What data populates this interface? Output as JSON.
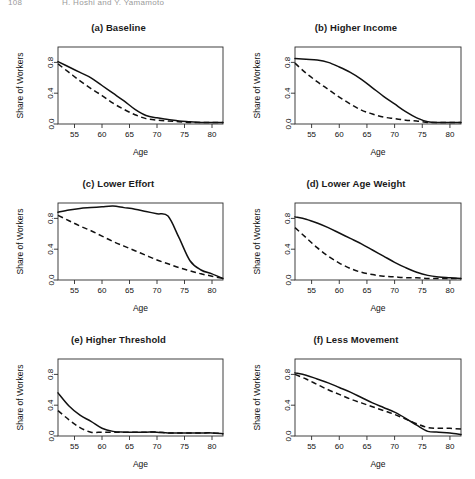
{
  "running_header": {
    "page_number": "108",
    "title": "H. Hoshi and Y. Yamamoto"
  },
  "figure": {
    "x_axis_label": "Age",
    "y_axis_label": "Share of Workers",
    "x_ticks": [
      55,
      60,
      65,
      70,
      75,
      80
    ],
    "y_ticks": [
      "0.0",
      "0.4",
      "0.8"
    ],
    "series_names": [
      "solid",
      "dashed"
    ]
  },
  "chart_data": [
    {
      "type": "line",
      "panel": "a",
      "title": "(a) Baseline",
      "xlabel": "Age",
      "ylabel": "Share of Workers",
      "xlim": [
        52,
        82
      ],
      "ylim": [
        0.0,
        1.0
      ],
      "xticks": [
        55,
        60,
        65,
        70,
        75,
        80
      ],
      "yticks": [
        0.0,
        0.4,
        0.8
      ],
      "grid": false,
      "legend": "none",
      "x": [
        52,
        54,
        56,
        58,
        60,
        62,
        64,
        66,
        68,
        70,
        72,
        74,
        76,
        78,
        80,
        82
      ],
      "series": [
        {
          "name": "solid",
          "style": "solid",
          "values": [
            0.81,
            0.74,
            0.67,
            0.6,
            0.5,
            0.4,
            0.3,
            0.19,
            0.11,
            0.08,
            0.06,
            0.04,
            0.03,
            0.02,
            0.02,
            0.02
          ]
        },
        {
          "name": "dashed",
          "style": "dashed",
          "values": [
            0.78,
            0.67,
            0.56,
            0.46,
            0.37,
            0.27,
            0.19,
            0.12,
            0.07,
            0.05,
            0.04,
            0.03,
            0.02,
            0.02,
            0.02,
            0.02
          ]
        }
      ]
    },
    {
      "type": "line",
      "panel": "b",
      "title": "(b) Higher Income",
      "xlabel": "Age",
      "ylabel": "Share of Workers",
      "xlim": [
        52,
        82
      ],
      "ylim": [
        0.0,
        1.0
      ],
      "xticks": [
        55,
        60,
        65,
        70,
        75,
        80
      ],
      "yticks": [
        0.0,
        0.4,
        0.8
      ],
      "grid": false,
      "legend": "none",
      "x": [
        52,
        54,
        56,
        58,
        60,
        62,
        64,
        66,
        68,
        70,
        72,
        74,
        76,
        78,
        80,
        82
      ],
      "series": [
        {
          "name": "solid",
          "style": "solid",
          "values": [
            0.85,
            0.84,
            0.83,
            0.8,
            0.74,
            0.67,
            0.58,
            0.47,
            0.36,
            0.26,
            0.16,
            0.08,
            0.03,
            0.02,
            0.02,
            0.02
          ]
        },
        {
          "name": "dashed",
          "style": "dashed",
          "values": [
            0.79,
            0.66,
            0.55,
            0.45,
            0.35,
            0.26,
            0.18,
            0.13,
            0.09,
            0.07,
            0.05,
            0.04,
            0.02,
            0.02,
            0.02,
            0.02
          ]
        }
      ]
    },
    {
      "type": "line",
      "panel": "c",
      "title": "(c) Lower Effort",
      "xlabel": "Age",
      "ylabel": "Share of Workers",
      "xlim": [
        52,
        82
      ],
      "ylim": [
        0.0,
        1.0
      ],
      "xticks": [
        55,
        60,
        65,
        70,
        75,
        80
      ],
      "yticks": [
        0.0,
        0.4,
        0.8
      ],
      "grid": false,
      "legend": "none",
      "x": [
        52,
        54,
        56,
        58,
        60,
        62,
        64,
        66,
        68,
        70,
        72,
        74,
        76,
        78,
        80,
        82
      ],
      "series": [
        {
          "name": "solid",
          "style": "solid",
          "values": [
            0.88,
            0.91,
            0.93,
            0.94,
            0.95,
            0.96,
            0.94,
            0.92,
            0.89,
            0.86,
            0.83,
            0.55,
            0.25,
            0.13,
            0.08,
            0.02
          ]
        },
        {
          "name": "dashed",
          "style": "dashed",
          "values": [
            0.84,
            0.77,
            0.7,
            0.64,
            0.57,
            0.5,
            0.44,
            0.38,
            0.32,
            0.26,
            0.21,
            0.16,
            0.12,
            0.08,
            0.05,
            0.02
          ]
        }
      ]
    },
    {
      "type": "line",
      "panel": "d",
      "title": "(d) Lower Age Weight",
      "xlabel": "Age",
      "ylabel": "Share of Workers",
      "xlim": [
        52,
        82
      ],
      "ylim": [
        0.0,
        1.0
      ],
      "xticks": [
        55,
        60,
        65,
        70,
        75,
        80
      ],
      "yticks": [
        0.0,
        0.4,
        0.8
      ],
      "grid": false,
      "legend": "none",
      "x": [
        52,
        54,
        56,
        58,
        60,
        62,
        64,
        66,
        68,
        70,
        72,
        74,
        76,
        78,
        80,
        82
      ],
      "series": [
        {
          "name": "solid",
          "style": "solid",
          "values": [
            0.82,
            0.79,
            0.74,
            0.68,
            0.61,
            0.54,
            0.47,
            0.39,
            0.31,
            0.23,
            0.16,
            0.1,
            0.06,
            0.04,
            0.03,
            0.02
          ]
        },
        {
          "name": "dashed",
          "style": "dashed",
          "values": [
            0.68,
            0.55,
            0.42,
            0.31,
            0.22,
            0.15,
            0.1,
            0.07,
            0.05,
            0.04,
            0.03,
            0.03,
            0.02,
            0.02,
            0.02,
            0.02
          ]
        }
      ]
    },
    {
      "type": "line",
      "panel": "e",
      "title": "(e) Higher Threshold",
      "xlabel": "Age",
      "ylabel": "Share of Workers",
      "xlim": [
        52,
        82
      ],
      "ylim": [
        0.0,
        1.0
      ],
      "xticks": [
        55,
        60,
        65,
        70,
        75,
        80
      ],
      "yticks": [
        0.0,
        0.4,
        0.8
      ],
      "grid": false,
      "legend": "none",
      "x": [
        52,
        54,
        56,
        58,
        60,
        62,
        64,
        66,
        68,
        70,
        72,
        74,
        76,
        78,
        80,
        82
      ],
      "series": [
        {
          "name": "solid",
          "style": "solid",
          "values": [
            0.56,
            0.39,
            0.27,
            0.19,
            0.1,
            0.06,
            0.05,
            0.05,
            0.05,
            0.05,
            0.04,
            0.04,
            0.04,
            0.04,
            0.04,
            0.03
          ]
        },
        {
          "name": "dashed",
          "style": "dashed",
          "values": [
            0.33,
            0.21,
            0.11,
            0.05,
            0.05,
            0.05,
            0.05,
            0.05,
            0.05,
            0.05,
            0.04,
            0.04,
            0.04,
            0.04,
            0.04,
            0.03
          ]
        }
      ]
    },
    {
      "type": "line",
      "panel": "f",
      "title": "(f) Less Movement",
      "xlabel": "Age",
      "ylabel": "Share of Workers",
      "xlim": [
        52,
        82
      ],
      "ylim": [
        0.0,
        1.0
      ],
      "xticks": [
        55,
        60,
        65,
        70,
        75,
        80
      ],
      "yticks": [
        0.0,
        0.4,
        0.8
      ],
      "grid": false,
      "legend": "none",
      "x": [
        52,
        54,
        56,
        58,
        60,
        62,
        64,
        66,
        68,
        70,
        72,
        74,
        76,
        78,
        80,
        82
      ],
      "series": [
        {
          "name": "solid",
          "style": "solid",
          "values": [
            0.82,
            0.79,
            0.74,
            0.69,
            0.63,
            0.57,
            0.5,
            0.43,
            0.37,
            0.31,
            0.23,
            0.14,
            0.06,
            0.05,
            0.04,
            0.02
          ]
        },
        {
          "name": "dashed",
          "style": "dashed",
          "values": [
            0.8,
            0.74,
            0.67,
            0.6,
            0.54,
            0.48,
            0.43,
            0.38,
            0.33,
            0.28,
            0.22,
            0.16,
            0.11,
            0.1,
            0.1,
            0.09
          ]
        }
      ]
    }
  ]
}
